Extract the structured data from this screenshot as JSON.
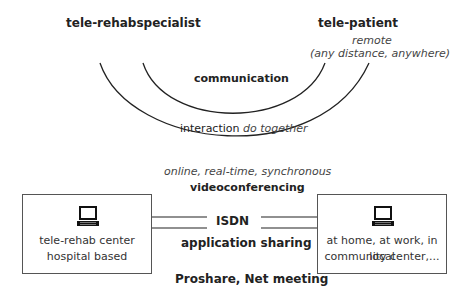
{
  "roles": {
    "specialist": "tele-rehabspecialist",
    "patient": "tele-patient",
    "patient_note_line1": "remote",
    "patient_note_line2": "(any distance, anywhere)"
  },
  "arcs": {
    "inner_label": "communication",
    "outer_label": "interaction",
    "outer_label_italic": "do together"
  },
  "connection": {
    "mode": "online, real-time, synchronous",
    "method": "videoconferencing",
    "line_label": "ISDN",
    "sharing": "application sharing",
    "software": "Proshare, Net meeting"
  },
  "left_box": {
    "icon": "laptop-icon",
    "line1": "tele-rehab center",
    "line2": "hospital based"
  },
  "right_box": {
    "icon": "laptop-icon",
    "line1": "at home, at work, in local",
    "line2": "community center,..."
  },
  "colors": {
    "line": "#222222",
    "box_border": "#555555"
  }
}
